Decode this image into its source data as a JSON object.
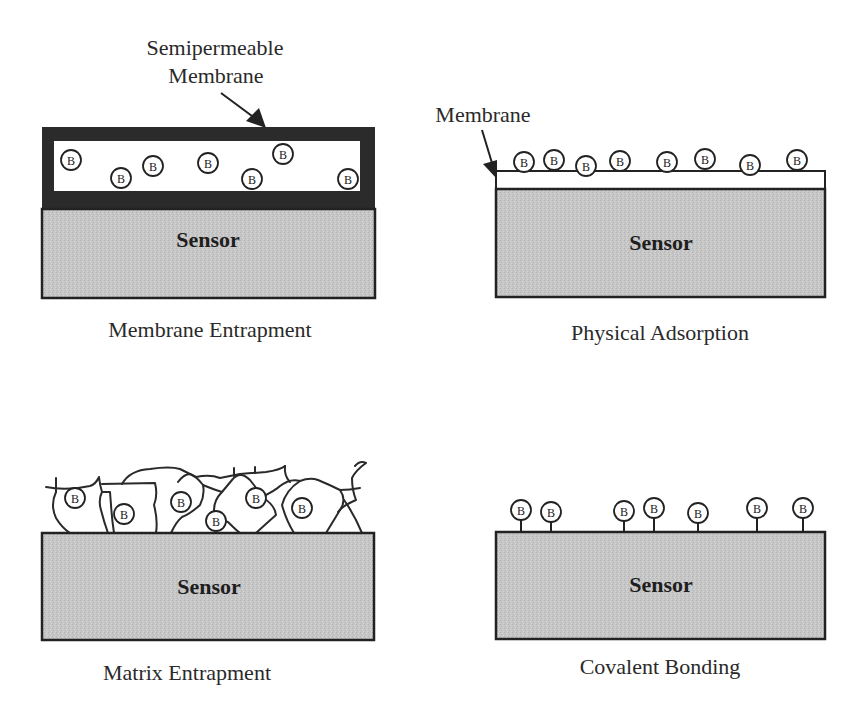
{
  "colors": {
    "sensor_fill": "#c9c9c9",
    "membrane_dark": "#2b2b2b",
    "outline": "#222222",
    "background": "#ffffff"
  },
  "sensor_label": "Sensor",
  "biomolecule_label": "B",
  "panels": [
    {
      "id": "membrane-entrapment",
      "caption": "Membrane Entrapment",
      "callout": {
        "lines": [
          "Semipermeable",
          "Membrane"
        ]
      },
      "biomolecules": [
        {
          "x": 71,
          "y": 160
        },
        {
          "x": 121,
          "y": 178
        },
        {
          "x": 153,
          "y": 166
        },
        {
          "x": 208,
          "y": 163
        },
        {
          "x": 252,
          "y": 179
        },
        {
          "x": 283,
          "y": 154
        },
        {
          "x": 348,
          "y": 179
        }
      ]
    },
    {
      "id": "physical-adsorption",
      "caption": "Physical Adsorption",
      "callout": {
        "lines": [
          "Membrane"
        ]
      },
      "biomolecules": [
        {
          "x": 524,
          "y": 162
        },
        {
          "x": 554,
          "y": 160
        },
        {
          "x": 586,
          "y": 166
        },
        {
          "x": 620,
          "y": 161
        },
        {
          "x": 667,
          "y": 162
        },
        {
          "x": 705,
          "y": 159
        },
        {
          "x": 750,
          "y": 165
        },
        {
          "x": 797,
          "y": 160
        }
      ]
    },
    {
      "id": "matrix-entrapment",
      "caption": "Matrix Entrapment",
      "biomolecules": [
        {
          "x": 75,
          "y": 498
        },
        {
          "x": 124,
          "y": 514
        },
        {
          "x": 181,
          "y": 502
        },
        {
          "x": 216,
          "y": 521
        },
        {
          "x": 256,
          "y": 498
        },
        {
          "x": 302,
          "y": 508
        }
      ]
    },
    {
      "id": "covalent-bonding",
      "caption": "Covalent Bonding",
      "biomolecules": [
        {
          "x": 521,
          "y": 510
        },
        {
          "x": 551,
          "y": 512
        },
        {
          "x": 624,
          "y": 511
        },
        {
          "x": 654,
          "y": 508
        },
        {
          "x": 698,
          "y": 513
        },
        {
          "x": 757,
          "y": 508
        },
        {
          "x": 803,
          "y": 508
        }
      ]
    }
  ]
}
